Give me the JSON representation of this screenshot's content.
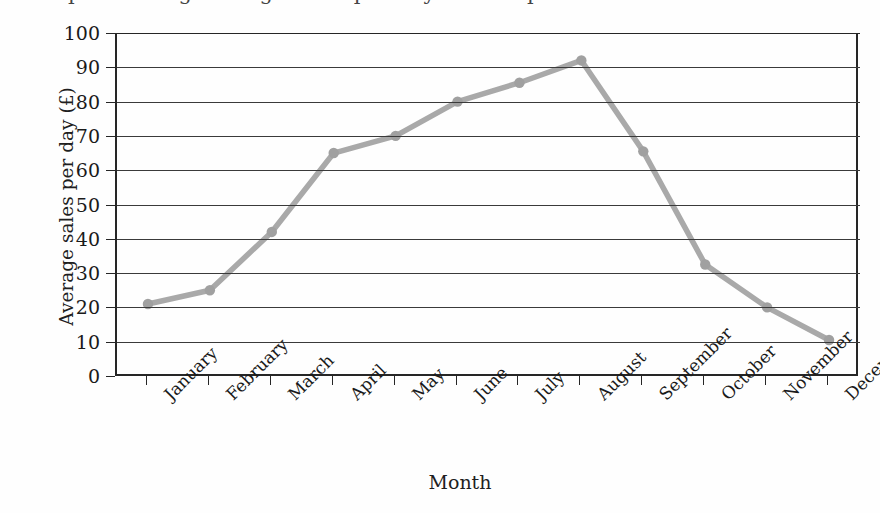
{
  "figure": {
    "title_clipped": "Graph showing average sales per day in a shop",
    "background_color": "#fefefe"
  },
  "chart_data": {
    "type": "line",
    "title": "Graph showing average sales per day in a shop",
    "xlabel": "Month",
    "ylabel": "Average sales per day (£)",
    "categories": [
      "January",
      "February",
      "March",
      "April",
      "May",
      "June",
      "July",
      "August",
      "September",
      "October",
      "November",
      "December"
    ],
    "values": [
      21,
      25,
      42,
      65,
      70,
      80,
      85.5,
      92,
      65.5,
      32.5,
      20,
      10.5
    ],
    "series": [
      {
        "name": "Average sales per day",
        "values": [
          21,
          25,
          42,
          65,
          70,
          80,
          85.5,
          92,
          65.5,
          32.5,
          20,
          10.5
        ],
        "line_color": "#a9a9a9",
        "marker": "circle",
        "marker_color": "#a0a0a0"
      }
    ],
    "ylim": [
      0,
      100
    ],
    "ytick_values": [
      0,
      10,
      20,
      30,
      40,
      50,
      60,
      70,
      80,
      90,
      100
    ],
    "ytick_labels": [
      "0",
      "10",
      "20",
      "30",
      "40",
      "50",
      "60",
      "70",
      "80",
      "90",
      "100"
    ],
    "grid": "horizontal",
    "grid_color": "#3a3a3a",
    "legend": "none",
    "axis_color": "#262626",
    "xtick_label_rotation": -45
  }
}
